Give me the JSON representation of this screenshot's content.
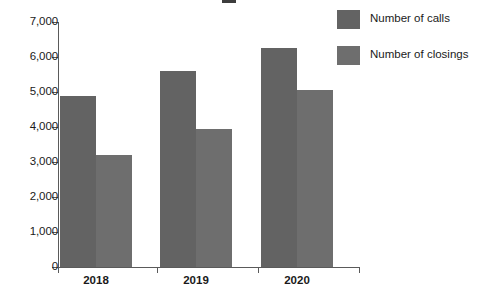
{
  "chart_data": {
    "type": "bar",
    "title": "",
    "xlabel": "",
    "ylabel": "",
    "categories": [
      "2018",
      "2019",
      "2020"
    ],
    "series": [
      {
        "name": "Number of calls",
        "values": [
          4900,
          5600,
          6250
        ],
        "color": "#636363"
      },
      {
        "name": "Number of closings",
        "values": [
          3200,
          3950,
          5050
        ],
        "color": "#6e6e6e"
      }
    ],
    "ylim": [
      0,
      7000
    ],
    "yticks": [
      0,
      1000,
      2000,
      3000,
      4000,
      5000,
      6000,
      7000
    ],
    "ytick_labels": [
      "0",
      "1,000",
      "2,000",
      "3,000",
      "4,000",
      "5,000",
      "6,000",
      "7,000"
    ],
    "grid": false,
    "legend_position": "top-right",
    "axis_color": "#5a5a5a",
    "background": "#ffffff"
  },
  "legend": {
    "items": [
      {
        "label": "Number of calls"
      },
      {
        "label": "Number of closings"
      }
    ]
  },
  "axes": {
    "x_labels": [
      "2018",
      "2019",
      "2020"
    ],
    "y_labels": [
      "7,000",
      "6,000",
      "5,000",
      "4,000",
      "3,000",
      "2,000",
      "1,000",
      "0"
    ]
  }
}
